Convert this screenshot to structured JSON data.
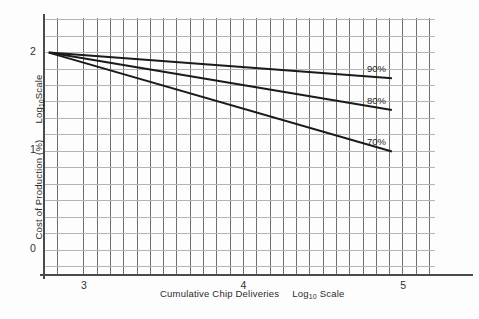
{
  "chart_data": {
    "type": "line",
    "title": "",
    "xlabel": "Cumulative Chip Deliveries",
    "xlabel_scale": "Log",
    "xlabel_scale_sub": "10",
    "xlabel_scale_tail": " Scale",
    "ylabel": "Cost of Production (%)",
    "ylabel_scale": "Log",
    "ylabel_scale_sub": "10",
    "ylabel_scale_tail": "Scale",
    "xlim": [
      2.75,
      5.2
    ],
    "ylim": [
      -0.25,
      2.35
    ],
    "xticks": [
      3,
      4,
      5
    ],
    "xtick_labels": [
      "3",
      "4",
      "5"
    ],
    "yticks": [
      0,
      1,
      2
    ],
    "ytick_labels": [
      "0",
      "1",
      "2"
    ],
    "grid": true,
    "grid_x_step": 0.0833,
    "grid_y_step": 0.1667,
    "legend_position": "inline-right",
    "x": [
      2.78,
      4.93
    ],
    "series": [
      {
        "name": "90%",
        "label": "90%",
        "values": [
          2.0,
          1.74
        ],
        "color": "#1a1a1a"
      },
      {
        "name": "80%",
        "label": "80%",
        "values": [
          2.0,
          1.42
        ],
        "color": "#1a1a1a"
      },
      {
        "name": "70%",
        "label": "70%",
        "values": [
          2.0,
          1.0
        ],
        "color": "#1a1a1a"
      }
    ]
  },
  "axes": {
    "x_tick_3": "3",
    "x_tick_4": "4",
    "x_tick_5": "5",
    "y_tick_0": "0",
    "y_tick_1": "1",
    "y_tick_2": "2"
  },
  "labels": {
    "x_axis_name": "Cumulative Chip Deliveries",
    "x_axis_scale_main": "Log",
    "x_axis_scale_sub": "10",
    "x_axis_scale_tail": "Scale",
    "y_axis_name": "Cost of Production (%)",
    "y_axis_scale_main": "Log",
    "y_axis_scale_sub": "10",
    "y_axis_scale_tail": "Scale",
    "series_90": "90%",
    "series_80": "80%",
    "series_70": "70%"
  },
  "colors": {
    "line": "#1a1a1a",
    "grid_vertical": "#6e6e6e",
    "grid_horizontal": "#b4b4b4",
    "axis": "#4a4a4a",
    "text": "#2b2b2b",
    "background": "#fdfdfd"
  }
}
